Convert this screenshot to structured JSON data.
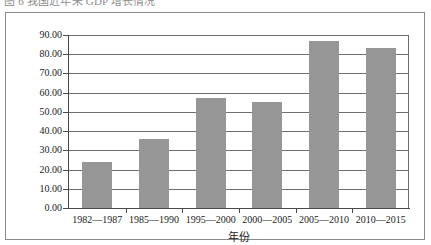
{
  "caption": {
    "text": "图 6  我国近年来 GDP 增长情况"
  },
  "chart_data": {
    "type": "bar",
    "title": "",
    "categories": [
      "1982—1987",
      "1985—1990",
      "1995—2000",
      "2000—2005",
      "2005—2010",
      "2010—2015"
    ],
    "values": [
      24.0,
      36.0,
      57.0,
      55.0,
      87.0,
      83.0
    ],
    "xlabel": "年份",
    "ylabel": "",
    "ylim": [
      0,
      90
    ],
    "ytick_values": [
      0,
      10,
      20,
      30,
      40,
      50,
      60,
      70,
      80,
      90
    ],
    "ytick_labels": [
      "0.00",
      "10.00",
      "20.00",
      "30.00",
      "40.00",
      "50.00",
      "60.00",
      "70.00",
      "80.00",
      "90.00"
    ],
    "grid": true,
    "legend": false,
    "bar_color": "#969696",
    "gridline_color": "#6f6f6f",
    "axis_color": "#4a4a4a",
    "frame_color": "#8a8a8a",
    "background": "#ffffff"
  }
}
